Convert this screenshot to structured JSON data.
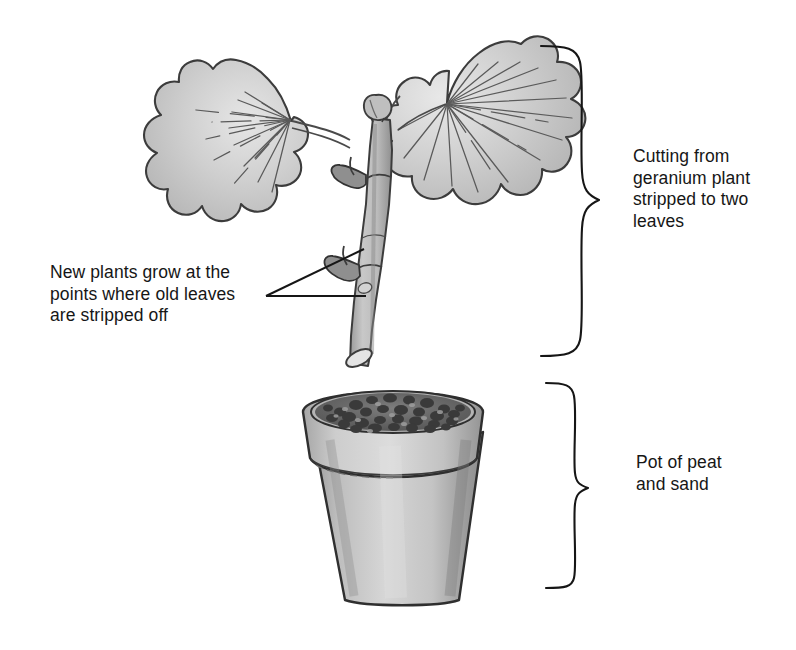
{
  "figure": {
    "background_color": "#ffffff",
    "ink_color": "#1a1a1a"
  },
  "labels": {
    "cutting": "Cutting from\ngeranium plant\nstripped to two\nleaves",
    "new_plants": "New plants grow at the\npoints where old leaves\nare stripped off",
    "pot": "Pot of peat\nand sand"
  },
  "illustration": {
    "leaf_left_name": "geranium-leaf-left",
    "leaf_right_name": "geranium-leaf-right",
    "stem_name": "cutting-stem",
    "bud_name": "growing-tip-bud",
    "node_upper_name": "stem-node-upper",
    "node_lower_name": "stem-node-lower",
    "cut_end_name": "angled-cut-end",
    "pot_name": "plant-pot",
    "compost_name": "peat-and-sand-compost",
    "leaf_fill": "#c9c9c9",
    "leaf_outline": "#3a3a3a",
    "stem_fill": "#b9b9b9",
    "pot_fill": "#c0c0c0",
    "pot_rim_fill": "#cccccc",
    "compost_fill": "#6e6e6e"
  },
  "annotations": {
    "brace_top_name": "brace-cutting",
    "brace_bottom_name": "brace-pot",
    "pointer_upper_name": "pointer-line-upper-node",
    "pointer_lower_name": "pointer-line-lower-node"
  }
}
